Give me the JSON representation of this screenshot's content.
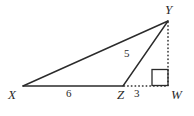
{
  "figure": {
    "name": "triangle-xyw-with-altitude",
    "background_color": "#ffffff",
    "stroke_color": "#2b2b2b",
    "text_color": "#2b2b2b"
  },
  "vertices": {
    "X": {
      "label": "X",
      "x": 23,
      "y": 86
    },
    "Y": {
      "label": "Y",
      "x": 168,
      "y": 21
    },
    "Z": {
      "label": "Z",
      "x": 123,
      "y": 86
    },
    "W": {
      "label": "W",
      "x": 168,
      "y": 86
    }
  },
  "measures": {
    "XZ": "6",
    "ZW": "3",
    "ZY": "5"
  },
  "segments": {
    "XY": {
      "style": "solid",
      "from": "X",
      "to": "Y"
    },
    "XZ": {
      "style": "solid",
      "from": "X",
      "to": "Z"
    },
    "ZY": {
      "style": "solid",
      "from": "Z",
      "to": "Y"
    },
    "ZW": {
      "style": "dotted",
      "from": "Z",
      "to": "W"
    },
    "YW": {
      "style": "dotted",
      "from": "Y",
      "to": "W"
    }
  },
  "right_angle": {
    "at_vertex": "W",
    "marker": "right-angle-square",
    "x": 152,
    "y": 69,
    "size": 16
  }
}
